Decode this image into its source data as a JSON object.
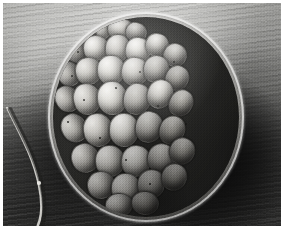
{
  "figure": {
    "kind": "scanning-electron-micrograph",
    "modality": "SEM",
    "color_mode": "grayscale",
    "width_px": 285,
    "height_px": 232,
    "border": {
      "color": "#ffffff",
      "top_px": 3,
      "left_px": 3,
      "right_px": 4,
      "bottom_px": 6
    },
    "subject_description": "spherical cluster of rounded polygonal blastomere cells enclosed by a thin outer membrane",
    "overlay_text": "",
    "scale_bar_text": "",
    "annotations": []
  },
  "background": {
    "description": "striated gray substrate with horizontal ridges, bright at upper-left, deep shadow at lower-right and lower-left",
    "tone_light": "#d8d8d6",
    "tone_mid": "#8f8f8c",
    "tone_dark": "#1a1a19",
    "shadow_color": "#080808"
  },
  "specimen": {
    "outline": {
      "shape": "circle",
      "center_x_px": 143,
      "center_y_px": 114,
      "radius_px": 98
    },
    "membrane": {
      "name": "zona-pellucida",
      "rim_highlight_color": "#f2f1ee",
      "rim_shadow_color": "#4b4a47"
    },
    "cell_count": 31,
    "cell_highlight_color": "#e6e5e1",
    "cell_midtone_color": "#a9a7a1",
    "cell_groove_color": "#2a2a28",
    "cells": [
      {
        "id": "c01",
        "x": 36.0,
        "y": 2.0,
        "w": 22.0,
        "h": 19.0,
        "r": "46% 54% 50% 50% / 50% 50% 50% 50%",
        "rot": -10,
        "tone": "bright"
      },
      {
        "id": "c02",
        "x": 54.0,
        "y": 0.5,
        "w": 25.0,
        "h": 20.0,
        "r": "50% 50% 48% 52% / 52% 48% 50% 50%",
        "rot": 6,
        "tone": ""
      },
      {
        "id": "c03",
        "x": 22.0,
        "y": 8.0,
        "w": 20.0,
        "h": 18.0,
        "r": "52% 48% 50% 50% / 48% 52% 50% 50%",
        "rot": -18,
        "tone": "dim"
      },
      {
        "id": "c04",
        "x": 72.0,
        "y": 5.0,
        "w": 20.0,
        "h": 18.0,
        "r": "48% 52% 52% 48% / 50% 50% 50% 50%",
        "rot": 14,
        "tone": "dim"
      },
      {
        "id": "c05",
        "x": 12.0,
        "y": 22.0,
        "w": 20.0,
        "h": 22.0,
        "r": "50% 50% 46% 54% / 54% 46% 50% 50%",
        "rot": -24,
        "tone": "dim"
      },
      {
        "id": "c06",
        "x": 30.0,
        "y": 18.0,
        "w": 24.0,
        "h": 24.0,
        "r": "46% 54% 54% 46% / 50% 50% 50% 50%",
        "rot": -6,
        "tone": "bright"
      },
      {
        "id": "c07",
        "x": 52.0,
        "y": 17.0,
        "w": 23.0,
        "h": 26.0,
        "r": "52% 48% 48% 52% / 50% 50% 52% 48%",
        "rot": 4,
        "tone": ""
      },
      {
        "id": "c08",
        "x": 72.0,
        "y": 20.0,
        "w": 24.0,
        "h": 24.0,
        "r": "48% 52% 50% 50% / 52% 48% 50% 50%",
        "rot": 10,
        "tone": "bright"
      },
      {
        "id": "c09",
        "x": 92.0,
        "y": 16.0,
        "w": 22.0,
        "h": 22.0,
        "r": "50% 50% 52% 48% / 48% 52% 50% 50%",
        "rot": 18,
        "tone": ""
      },
      {
        "id": "c10",
        "x": 110.0,
        "y": 26.0,
        "w": 22.0,
        "h": 22.0,
        "r": "50% 50% 48% 52% / 50% 50% 50% 50%",
        "rot": 24,
        "tone": "dim"
      },
      {
        "id": "c11",
        "x": 4.0,
        "y": 44.0,
        "w": 21.0,
        "h": 24.0,
        "r": "54% 46% 48% 52% / 50% 50% 50% 50%",
        "rot": -30,
        "tone": "dim"
      },
      {
        "id": "c12",
        "x": 22.0,
        "y": 40.0,
        "w": 25.0,
        "h": 26.0,
        "r": "48% 52% 52% 48% / 52% 48% 50% 50%",
        "rot": -12,
        "tone": ""
      },
      {
        "id": "c13",
        "x": 44.0,
        "y": 38.0,
        "w": 26.0,
        "h": 28.0,
        "r": "50% 50% 48% 52% / 48% 52% 50% 50%",
        "rot": 0,
        "tone": "bright"
      },
      {
        "id": "c14",
        "x": 68.0,
        "y": 40.0,
        "w": 26.0,
        "h": 27.0,
        "r": "46% 54% 50% 50% / 50% 50% 52% 48%",
        "rot": 8,
        "tone": ""
      },
      {
        "id": "c15",
        "x": 90.0,
        "y": 38.0,
        "w": 24.0,
        "h": 26.0,
        "r": "52% 48% 50% 50% / 50% 50% 48% 52%",
        "rot": 16,
        "tone": "dim"
      },
      {
        "id": "c16",
        "x": 112.0,
        "y": 48.0,
        "w": 22.0,
        "h": 24.0,
        "r": "50% 50% 52% 48% / 52% 48% 50% 50%",
        "rot": 26,
        "tone": "dark"
      },
      {
        "id": "c17",
        "x": 2.0,
        "y": 68.0,
        "w": 22.0,
        "h": 26.0,
        "r": "52% 48% 48% 52% / 50% 50% 50% 50%",
        "rot": -34,
        "tone": "dim"
      },
      {
        "id": "c18",
        "x": 20.0,
        "y": 66.0,
        "w": 26.0,
        "h": 30.0,
        "r": "48% 52% 52% 48% / 50% 50% 50% 50%",
        "rot": -14,
        "tone": ""
      },
      {
        "id": "c19",
        "x": 44.0,
        "y": 64.0,
        "w": 28.0,
        "h": 32.0,
        "r": "50% 50% 46% 54% / 48% 52% 50% 50%",
        "rot": -2,
        "tone": "bright"
      },
      {
        "id": "c20",
        "x": 70.0,
        "y": 66.0,
        "w": 26.0,
        "h": 30.0,
        "r": "46% 54% 52% 48% / 52% 48% 50% 50%",
        "rot": 10,
        "tone": "dim"
      },
      {
        "id": "c21",
        "x": 94.0,
        "y": 62.0,
        "w": 24.0,
        "h": 28.0,
        "r": "52% 48% 50% 50% / 50% 50% 52% 48%",
        "rot": 20,
        "tone": ""
      },
      {
        "id": "c22",
        "x": 116.0,
        "y": 72.0,
        "w": 22.0,
        "h": 26.0,
        "r": "50% 50% 52% 48% / 50% 50% 48% 52%",
        "rot": 30,
        "tone": "dark"
      },
      {
        "id": "c23",
        "x": 8.0,
        "y": 96.0,
        "w": 24.0,
        "h": 28.0,
        "r": "52% 48% 48% 52% / 50% 50% 50% 50%",
        "rot": -30,
        "tone": "dim"
      },
      {
        "id": "c24",
        "x": 30.0,
        "y": 96.0,
        "w": 28.0,
        "h": 32.0,
        "r": "48% 52% 50% 50% / 50% 50% 50% 50%",
        "rot": -10,
        "tone": ""
      },
      {
        "id": "c25",
        "x": 56.0,
        "y": 96.0,
        "w": 28.0,
        "h": 32.0,
        "r": "50% 50% 48% 52% / 48% 52% 50% 50%",
        "rot": 2,
        "tone": "bright"
      },
      {
        "id": "c26",
        "x": 82.0,
        "y": 94.0,
        "w": 26.0,
        "h": 30.0,
        "r": "46% 54% 52% 48% / 52% 48% 50% 50%",
        "rot": 12,
        "tone": "dim"
      },
      {
        "id": "c27",
        "x": 106.0,
        "y": 98.0,
        "w": 24.0,
        "h": 28.0,
        "r": "52% 48% 50% 50% / 50% 50% 50% 50%",
        "rot": 24,
        "tone": "dark"
      },
      {
        "id": "c28",
        "x": 18.0,
        "y": 126.0,
        "w": 26.0,
        "h": 28.0,
        "r": "50% 50% 50% 50% / 50% 50% 50% 50%",
        "rot": -20,
        "tone": "dim"
      },
      {
        "id": "c29",
        "x": 42.0,
        "y": 128.0,
        "w": 28.0,
        "h": 30.0,
        "r": "48% 52% 50% 50% / 50% 50% 50% 50%",
        "rot": -4,
        "tone": ""
      },
      {
        "id": "c30",
        "x": 68.0,
        "y": 128.0,
        "w": 28.0,
        "h": 30.0,
        "r": "50% 50% 52% 48% / 50% 50% 50% 50%",
        "rot": 8,
        "tone": "bright"
      },
      {
        "id": "c31",
        "x": 94.0,
        "y": 126.0,
        "w": 26.0,
        "h": 28.0,
        "r": "52% 48% 48% 52% / 50% 50% 50% 50%",
        "rot": 20,
        "tone": "dim"
      },
      {
        "id": "c32",
        "x": 116.0,
        "y": 120.0,
        "w": 24.0,
        "h": 26.0,
        "r": "50% 50% 50% 50% / 50% 50% 50% 50%",
        "rot": 30,
        "tone": "dark"
      },
      {
        "id": "c33",
        "x": 34.0,
        "y": 154.0,
        "w": 26.0,
        "h": 26.0,
        "r": "50% 50% 50% 50% / 50% 50% 50% 50%",
        "rot": -12,
        "tone": "dim"
      },
      {
        "id": "c34",
        "x": 58.0,
        "y": 156.0,
        "w": 28.0,
        "h": 28.0,
        "r": "48% 52% 50% 50% / 50% 50% 50% 50%",
        "rot": 0,
        "tone": ""
      },
      {
        "id": "c35",
        "x": 84.0,
        "y": 152.0,
        "w": 26.0,
        "h": 28.0,
        "r": "52% 48% 50% 50% / 50% 50% 50% 50%",
        "rot": 14,
        "tone": "dim"
      },
      {
        "id": "c36",
        "x": 108.0,
        "y": 146.0,
        "w": 24.0,
        "h": 26.0,
        "r": "50% 50% 50% 50% / 50% 50% 50% 50%",
        "rot": 26,
        "tone": "dark"
      },
      {
        "id": "c37",
        "x": 52.0,
        "y": 176.0,
        "w": 26.0,
        "h": 22.0,
        "r": "50% 50% 50% 50% / 50% 50% 50% 50%",
        "rot": -6,
        "tone": "dim"
      },
      {
        "id": "c38",
        "x": 78.0,
        "y": 174.0,
        "w": 26.0,
        "h": 22.0,
        "r": "50% 50% 50% 50% / 50% 50% 50% 50%",
        "rot": 8,
        "tone": "dark"
      }
    ],
    "specks": [
      {
        "x": 24.0,
        "y": 34.0,
        "d": 2.2
      },
      {
        "x": 18.0,
        "y": 58.0,
        "d": 2.0
      },
      {
        "x": 30.0,
        "y": 82.0,
        "d": 2.4
      },
      {
        "x": 14.0,
        "y": 104.0,
        "d": 1.8
      },
      {
        "x": 62.0,
        "y": 70.0,
        "d": 1.6
      },
      {
        "x": 86.0,
        "y": 54.0,
        "d": 1.8
      },
      {
        "x": 104.0,
        "y": 88.0,
        "d": 2.2
      },
      {
        "x": 120.0,
        "y": 44.0,
        "d": 1.6
      },
      {
        "x": 72.0,
        "y": 142.0,
        "d": 2.0
      },
      {
        "x": 96.0,
        "y": 166.0,
        "d": 2.2
      },
      {
        "x": 46.0,
        "y": 120.0,
        "d": 1.6
      },
      {
        "x": 132.0,
        "y": 106.0,
        "d": 1.8
      }
    ]
  },
  "filament": {
    "name": "stray-fibre",
    "description": "thin bright curved fibre crossing the lower-left background",
    "color": "#d9d8d4",
    "path": "M 8 0 C 20 26, 34 48, 40 78 C 45 102, 42 116, 34 128"
  }
}
